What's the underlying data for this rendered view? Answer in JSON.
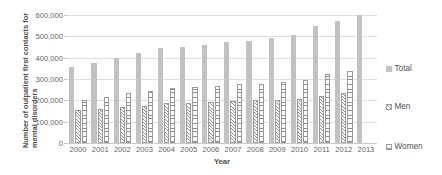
{
  "chart_data": {
    "type": "bar",
    "title": "",
    "xlabel": "Year",
    "ylabel": "Number of outpatient first contacts for mental disorders",
    "categories": [
      "2000",
      "2001",
      "2002",
      "2003",
      "2004",
      "2005",
      "2006",
      "2007",
      "2008",
      "2009",
      "2010",
      "2011",
      "2012",
      "2013"
    ],
    "series": [
      {
        "name": "Total",
        "values": [
          355000,
          375000,
          400000,
          420000,
          447000,
          448000,
          460000,
          472000,
          480000,
          490000,
          505000,
          550000,
          570000,
          600000
        ]
      },
      {
        "name": "Men",
        "values": [
          155000,
          158000,
          170000,
          175000,
          188000,
          188000,
          193000,
          196000,
          200000,
          200000,
          207000,
          222000,
          233000,
          null
        ]
      },
      {
        "name": "Women",
        "values": [
          203000,
          215000,
          233000,
          245000,
          257000,
          262000,
          268000,
          275000,
          278000,
          288000,
          297000,
          322000,
          337000,
          null
        ]
      }
    ],
    "ylim": [
      0,
      600000
    ],
    "yticks": [
      "0",
      "100,000",
      "200,000",
      "300,000",
      "400,000",
      "500,000",
      "600,000"
    ],
    "ytick_values": [
      0,
      100000,
      200000,
      300000,
      400000,
      500000,
      600000
    ],
    "grid": true,
    "legend_position": "right",
    "legend": [
      {
        "label": "Total",
        "swatch": "solid-gray"
      },
      {
        "label": "Men",
        "swatch": "diagonal-hatch"
      },
      {
        "label": "Women",
        "swatch": "horizontal-hatch"
      }
    ],
    "colors": {
      "total": "#c2c2c2",
      "hatch": "#8e8e8e",
      "grid": "#dedede",
      "text": "#5a5a5a"
    }
  }
}
